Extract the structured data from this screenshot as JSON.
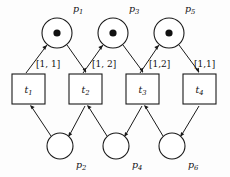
{
  "diagram": {
    "type": "petri-net",
    "background_color": "#fdfdfd",
    "stroke_color": "#1a1a1a",
    "token_color": "#111111",
    "places": [
      {
        "id": "p1",
        "label": "p",
        "sub": "1",
        "cx": 57,
        "cy": 33,
        "r": 15,
        "tokens": 1,
        "label_x": 73,
        "label_y": 12,
        "row": "top"
      },
      {
        "id": "p3",
        "label": "p",
        "sub": "3",
        "cx": 113,
        "cy": 33,
        "r": 15,
        "tokens": 1,
        "label_x": 129,
        "label_y": 12,
        "row": "top"
      },
      {
        "id": "p5",
        "label": "p",
        "sub": "5",
        "cx": 169,
        "cy": 33,
        "r": 15,
        "tokens": 1,
        "label_x": 185,
        "label_y": 12,
        "row": "top"
      },
      {
        "id": "p2",
        "label": "p",
        "sub": "2",
        "cx": 60,
        "cy": 146,
        "r": 13,
        "tokens": 0,
        "label_x": 76,
        "label_y": 168,
        "row": "bottom"
      },
      {
        "id": "p4",
        "label": "p",
        "sub": "4",
        "cx": 116,
        "cy": 146,
        "r": 13,
        "tokens": 0,
        "label_x": 132,
        "label_y": 168,
        "row": "bottom"
      },
      {
        "id": "p6",
        "label": "p",
        "sub": "6",
        "cx": 172,
        "cy": 146,
        "r": 13,
        "tokens": 0,
        "label_x": 188,
        "label_y": 168,
        "row": "bottom"
      }
    ],
    "transitions": [
      {
        "id": "t1",
        "label": "t",
        "sub": "1",
        "x": 12,
        "y": 74,
        "w": 33,
        "h": 30
      },
      {
        "id": "t2",
        "label": "t",
        "sub": "2",
        "x": 69,
        "y": 74,
        "w": 33,
        "h": 30
      },
      {
        "id": "t3",
        "label": "t",
        "sub": "3",
        "x": 126,
        "y": 74,
        "w": 33,
        "h": 30
      },
      {
        "id": "t4",
        "label": "t",
        "sub": "4",
        "x": 183,
        "y": 74,
        "w": 33,
        "h": 30
      }
    ],
    "arc_labels": [
      {
        "id": "a1",
        "text": "[1, 1]",
        "x": 36,
        "y": 67
      },
      {
        "id": "a2",
        "text": "[1, 2]",
        "x": 92,
        "y": 67
      },
      {
        "id": "a3",
        "text": "[1,2]",
        "x": 149,
        "y": 67
      },
      {
        "id": "a4",
        "text": "[1,1]",
        "x": 194,
        "y": 67
      }
    ],
    "arcs": [
      {
        "id": "arc-t1-p1",
        "from": "t1",
        "to": "p1",
        "direction": "transition-to-place"
      },
      {
        "id": "arc-p1-t2",
        "from": "p1",
        "to": "t2",
        "direction": "place-to-transition"
      },
      {
        "id": "arc-t2-p3",
        "from": "t2",
        "to": "p3",
        "direction": "transition-to-place"
      },
      {
        "id": "arc-p3-t3",
        "from": "p3",
        "to": "t3",
        "direction": "place-to-transition"
      },
      {
        "id": "arc-t3-p5",
        "from": "t3",
        "to": "p5",
        "direction": "transition-to-place"
      },
      {
        "id": "arc-p5-t4",
        "from": "p5",
        "to": "t4",
        "direction": "place-to-transition"
      },
      {
        "id": "arc-p2-t1",
        "from": "p2",
        "to": "t1",
        "direction": "place-to-transition"
      },
      {
        "id": "arc-t2-p2",
        "from": "t2",
        "to": "p2",
        "direction": "transition-to-place"
      },
      {
        "id": "arc-p4-t2",
        "from": "p4",
        "to": "t2",
        "direction": "place-to-transition"
      },
      {
        "id": "arc-t3-p4",
        "from": "t3",
        "to": "p4",
        "direction": "transition-to-place"
      },
      {
        "id": "arc-p6-t3",
        "from": "p6",
        "to": "t3",
        "direction": "place-to-transition"
      },
      {
        "id": "arc-t4-p6",
        "from": "t4",
        "to": "p6",
        "direction": "transition-to-place"
      }
    ]
  }
}
